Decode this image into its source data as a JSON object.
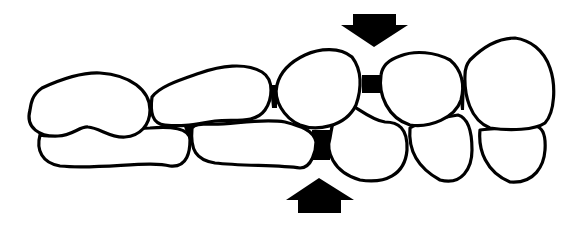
{
  "diagram": {
    "colors": {
      "line": "#000000",
      "fill": "#ffffff"
    },
    "elements": {
      "arrow_top": {
        "direction": "down"
      },
      "arrow_bottom": {
        "direction": "up"
      },
      "upper_teeth_count": 5,
      "lower_teeth_count": 5
    }
  }
}
